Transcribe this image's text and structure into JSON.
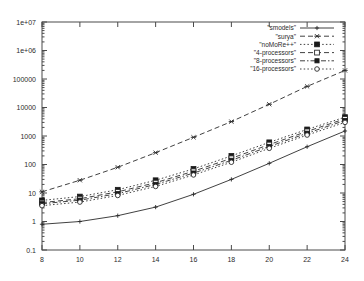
{
  "chart_data": {
    "type": "line",
    "title": "",
    "xlabel": "",
    "ylabel": "",
    "xlim": [
      8,
      24
    ],
    "ylim": [
      0.1,
      10000000
    ],
    "yscale": "log",
    "xscale": "linear",
    "grid": false,
    "legend_position": "top-right",
    "xticks": [
      8,
      10,
      12,
      14,
      16,
      18,
      20,
      22,
      24
    ],
    "xticklabels": [
      "8",
      "10",
      "12",
      "14",
      "16",
      "18",
      "20",
      "22",
      "24"
    ],
    "yticks": [
      0.1,
      1,
      10,
      100,
      1000,
      10000,
      100000,
      1000000,
      10000000
    ],
    "yticklabels": [
      "0.1",
      "1",
      "10",
      "100",
      "1000",
      "10000",
      "100000",
      "1e+06",
      "1e+07"
    ],
    "x": [
      8,
      10,
      12,
      14,
      16,
      18,
      20,
      22,
      24
    ],
    "series": [
      {
        "name": "\"smodels\"",
        "marker": "plus",
        "linestyle": "solid",
        "values": [
          0.8,
          1.0,
          1.6,
          3.2,
          9.0,
          30,
          110,
          420,
          1500
        ]
      },
      {
        "name": "\"surya\"",
        "marker": "cross",
        "linestyle": "dashed",
        "values": [
          11,
          28,
          80,
          260,
          900,
          3200,
          13000,
          55000,
          200000
        ]
      },
      {
        "name": "\"noMoRe++\"",
        "marker": "filled-square",
        "linestyle": "dotted",
        "values": [
          5.5,
          7.5,
          13,
          28,
          70,
          200,
          600,
          1700,
          4600
        ]
      },
      {
        "name": "\"4-processors\"",
        "marker": "open-square",
        "linestyle": "dashed",
        "values": [
          4.6,
          6.3,
          11,
          23,
          58,
          165,
          500,
          1450,
          4000
        ]
      },
      {
        "name": "\"8-processors\"",
        "marker": "filled-square-small",
        "linestyle": "dash-dot",
        "values": [
          4.2,
          5.6,
          9.5,
          20,
          50,
          140,
          430,
          1250,
          3500
        ]
      },
      {
        "name": "\"16-processors\"",
        "marker": "open-circle",
        "linestyle": "dotted",
        "values": [
          3.6,
          4.8,
          8.2,
          17,
          43,
          120,
          370,
          1080,
          3000
        ]
      }
    ]
  }
}
